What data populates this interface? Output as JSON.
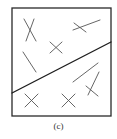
{
  "figure": {
    "caption": "(c)",
    "colors": {
      "frame": "#2a2a2a",
      "divider": "#1e1e1e",
      "marks": "#555555",
      "background": "#ffffff"
    },
    "frame": {
      "x": 12,
      "y": 8,
      "width": 99,
      "height": 108
    },
    "divider_line": {
      "x1": 12,
      "y1": 93,
      "x2": 111,
      "y2": 42
    },
    "marks": [
      {
        "id": "mark-top-left-x",
        "segments": [
          [
            24,
            19,
            36,
            41
          ],
          [
            34,
            19,
            26,
            41
          ]
        ]
      },
      {
        "id": "mark-center-small-x",
        "segments": [
          [
            50,
            42,
            62,
            53
          ],
          [
            62,
            42,
            50,
            53
          ]
        ]
      },
      {
        "id": "mark-top-right-crossed-line",
        "segments": [
          [
            73,
            30,
            100,
            20
          ],
          [
            74,
            23,
            86,
            32
          ]
        ]
      },
      {
        "id": "mark-left-single-slash",
        "segments": [
          [
            23,
            52,
            36,
            72
          ]
        ]
      },
      {
        "id": "mark-lower-right-long-line",
        "segments": [
          [
            73,
            82,
            98,
            63
          ]
        ]
      },
      {
        "id": "mark-lower-right-x",
        "segments": [
          [
            88,
            95,
            99,
            72
          ],
          [
            86,
            86,
            98,
            96
          ]
        ]
      },
      {
        "id": "mark-bottom-left-x",
        "segments": [
          [
            25,
            94,
            38,
            107
          ],
          [
            38,
            94,
            25,
            107
          ]
        ]
      },
      {
        "id": "mark-bottom-middle-x",
        "segments": [
          [
            62,
            94,
            75,
            107
          ],
          [
            75,
            94,
            62,
            107
          ]
        ]
      }
    ]
  }
}
